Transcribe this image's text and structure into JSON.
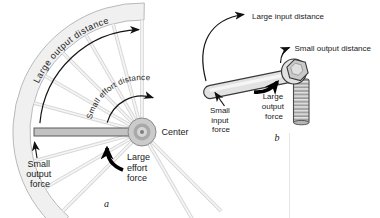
{
  "figure": {
    "ink_color": "#1a1a1a",
    "rim_fill": "#f0f0f0",
    "metal_light": "#e2e2e2",
    "metal_mid": "#c9c9c9",
    "wheel": {
      "caption": "a",
      "outer_arc_label": "Large output distance",
      "inner_arc_label": "Small effort distance",
      "center_label": "Center",
      "small_output_force": [
        "Small",
        "output",
        "force"
      ],
      "large_effort_force": [
        "Large",
        "effort",
        "force"
      ]
    },
    "wrench": {
      "caption": "b",
      "input_distance_label": "Large input distance",
      "output_distance_label": "Small output distance",
      "small_input_force": [
        "Small",
        "input",
        "force"
      ],
      "large_output_force": [
        "Large",
        "output",
        "force"
      ]
    }
  }
}
